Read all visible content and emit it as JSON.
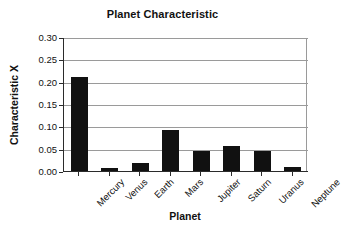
{
  "chart_data": {
    "type": "bar",
    "title": "Planet Characteristic",
    "xlabel": "Planet",
    "ylabel": "Characteristic X",
    "categories": [
      "Mercury",
      "Venus",
      "Earth",
      "Mars",
      "Jupiter",
      "Saturn",
      "Uranus",
      "Neptune"
    ],
    "values": [
      0.21,
      0.007,
      0.018,
      0.092,
      0.045,
      0.057,
      0.044,
      0.008
    ],
    "ylim": [
      0.0,
      0.3
    ],
    "ytick_labels": [
      "0.30",
      "0.25",
      "0.20",
      "0.15",
      "0.10",
      "0.05",
      "0.00"
    ],
    "ytick_values": [
      0.3,
      0.25,
      0.2,
      0.15,
      0.1,
      0.05,
      0.0
    ],
    "ytick_step": 0.05,
    "grid": true,
    "grid_axis": "y",
    "legend": false,
    "bar_color": "#111111",
    "grid_color": "#9a9a9a",
    "axis_color": "#2b2b2b",
    "background_color": "#ffffff",
    "xtick_label_rotation": -45
  }
}
